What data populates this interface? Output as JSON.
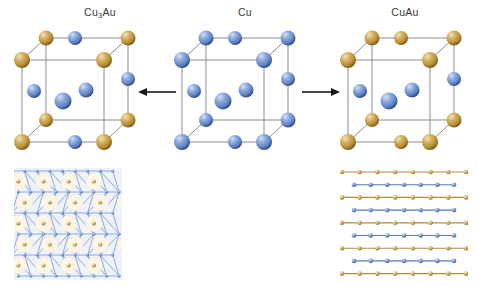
{
  "figure": {
    "title_left": "Cu",
    "background": "#ffffff",
    "width": 478,
    "height": 286
  },
  "colors": {
    "gold_atom": "#c9a04a",
    "gold_atom_light": "#e6cf92",
    "gold_atom_dark": "#8d6a22",
    "blue_atom": "#6d8fcf",
    "blue_atom_light": "#b9cdee",
    "blue_atom_dark": "#36548f",
    "cell_edge": "#8a8a8a",
    "bond_gold": "#b08d3f",
    "bond_blue": "#5878b8",
    "lattice_line": "#7d9ad4",
    "lattice_fill": "#eef3fb",
    "arrow": "#1a1a1a",
    "label_text": "#3a3a3a"
  },
  "panels": [
    {
      "id": "cu3au",
      "label_main": "Cu",
      "label_sub": "3",
      "label_tail": "Au",
      "label_full": "Cu3Au",
      "structure": "L1_2 ordered fcc",
      "corner_species": "Au",
      "face_species": "Cu",
      "cell_atoms": {
        "gold_count": 8,
        "blue_count": 6
      }
    },
    {
      "id": "cu",
      "label_main": "Cu",
      "label_sub": "",
      "label_tail": "",
      "label_full": "Cu",
      "structure": "fcc",
      "corner_species": "Cu",
      "face_species": "Cu",
      "cell_atoms": {
        "gold_count": 0,
        "blue_count": 14
      }
    },
    {
      "id": "cuau",
      "label_main": "CuAu",
      "label_sub": "",
      "label_tail": "",
      "label_full": "CuAu",
      "structure": "L1_0 ordered fct",
      "corner_species": "Au",
      "face_species": "mixed",
      "cell_atoms": {
        "gold_count": 10,
        "blue_count": 4
      }
    }
  ],
  "arrows": [
    {
      "id": "arrow-left",
      "direction": "left",
      "glyph": "←"
    },
    {
      "id": "arrow-right",
      "direction": "right",
      "glyph": "→"
    }
  ],
  "lattice_left": {
    "id": "kagome-lattice",
    "type": "triangular-kagome net",
    "description": "Cu triangular network with Au atoms centred in hexagonal voids",
    "rows_of_au": 5,
    "au_per_row": [
      4,
      5,
      4,
      5,
      4
    ],
    "node_species": "Cu",
    "center_species": "Au"
  },
  "lattice_right": {
    "id": "alternating-rows-lattice",
    "type": "alternating linear chains",
    "description": "Alternating Au and Cu atomic rows (L1_0 layering)",
    "row_count": 9,
    "rows": [
      {
        "species": "Au",
        "atoms": 8,
        "width": "wide"
      },
      {
        "species": "Cu",
        "atoms": 7,
        "width": "narrow"
      },
      {
        "species": "Au",
        "atoms": 8,
        "width": "wide"
      },
      {
        "species": "Cu",
        "atoms": 7,
        "width": "narrow"
      },
      {
        "species": "Au",
        "atoms": 8,
        "width": "wide"
      },
      {
        "species": "Cu",
        "atoms": 7,
        "width": "narrow"
      },
      {
        "species": "Au",
        "atoms": 8,
        "width": "wide"
      },
      {
        "species": "Cu",
        "atoms": 7,
        "width": "narrow"
      },
      {
        "species": "Au",
        "atoms": 8,
        "width": "wide"
      }
    ]
  }
}
